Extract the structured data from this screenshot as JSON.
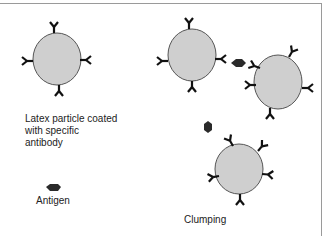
{
  "labels": {
    "latex_particle": "Latex particle coated\nwith specific\nantibody",
    "latex_line1": "Latex particle coated",
    "latex_line2": "with specific",
    "latex_line3": "antibody",
    "antigen": "Antigen",
    "clumping": "Clumping"
  },
  "colors": {
    "particle_fill": "#cfcfcf",
    "particle_stroke": "#555555",
    "antibody": "#111111",
    "antigen": "#2a2a2a",
    "border": "#9a9a9a"
  }
}
